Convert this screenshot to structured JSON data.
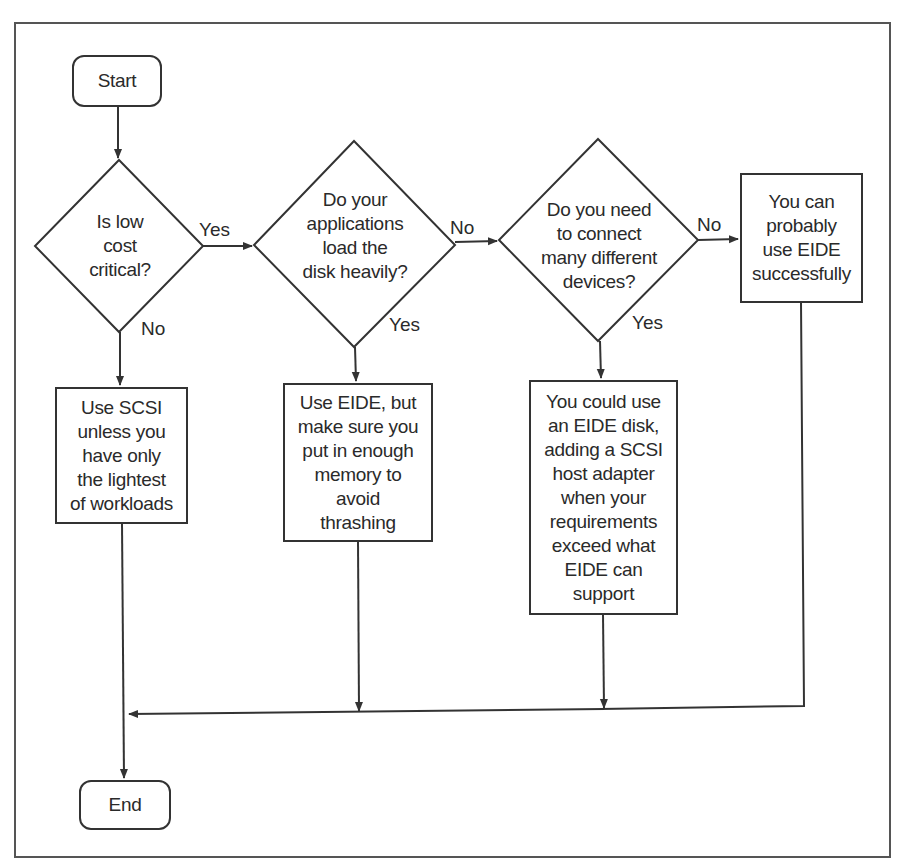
{
  "diagram": {
    "type": "flowchart",
    "nodes": {
      "start": {
        "label": "Start",
        "shape": "rounded-rect"
      },
      "q_low_cost": {
        "label": "Is low\ncost\ncritical?",
        "shape": "diamond"
      },
      "q_load_disk": {
        "label": "Do your\napplications\nload the\ndisk heavily?",
        "shape": "diamond"
      },
      "q_many_devices": {
        "label": "Do you need\nto connect\nmany different\ndevices?",
        "shape": "diamond"
      },
      "r_eide_ok": {
        "label": "You can\nprobably\nuse EIDE\nsuccessfully",
        "shape": "rect"
      },
      "r_use_scsi": {
        "label": "Use SCSI\nunless you\nhave only\nthe lightest\nof workloads",
        "shape": "rect"
      },
      "r_eide_memory": {
        "label": "Use EIDE, but\nmake sure you\nput in enough\nmemory to\navoid\nthrashing",
        "shape": "rect"
      },
      "r_eide_scsi_adapter": {
        "label": "You could use\nan EIDE disk,\nadding a SCSI\nhost adapter\nwhen your\nrequirements\nexceed what\nEIDE can\nsupport",
        "shape": "rect"
      },
      "end": {
        "label": "End",
        "shape": "rounded-rect"
      }
    },
    "edges": [
      {
        "from": "start",
        "to": "q_low_cost",
        "label": ""
      },
      {
        "from": "q_low_cost",
        "to": "q_load_disk",
        "label": "Yes"
      },
      {
        "from": "q_low_cost",
        "to": "r_use_scsi",
        "label": "No"
      },
      {
        "from": "q_load_disk",
        "to": "q_many_devices",
        "label": "No"
      },
      {
        "from": "q_load_disk",
        "to": "r_eide_memory",
        "label": "Yes"
      },
      {
        "from": "q_many_devices",
        "to": "r_eide_ok",
        "label": "No"
      },
      {
        "from": "q_many_devices",
        "to": "r_eide_scsi_adapter",
        "label": "Yes"
      },
      {
        "from": "r_use_scsi",
        "to": "end",
        "label": ""
      },
      {
        "from": "r_eide_memory",
        "to": "end",
        "label": ""
      },
      {
        "from": "r_eide_scsi_adapter",
        "to": "end",
        "label": ""
      },
      {
        "from": "r_eide_ok",
        "to": "end",
        "label": ""
      }
    ],
    "edge_labels": {
      "q1_yes": "Yes",
      "q1_no": "No",
      "q2_no": "No",
      "q2_yes": "Yes",
      "q3_no": "No",
      "q3_yes": "Yes"
    }
  }
}
